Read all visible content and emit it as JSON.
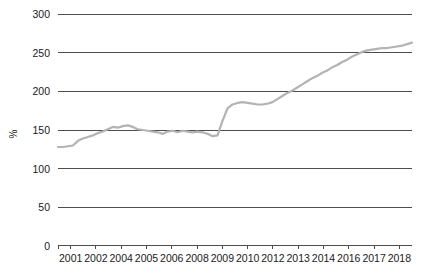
{
  "chart_data": {
    "type": "line",
    "title": "",
    "subtitle": "",
    "xlabel": "",
    "ylabel": "%",
    "ylim": [
      0,
      300
    ],
    "xlim": [
      2001,
      2018.75
    ],
    "y_ticks": [
      0,
      50,
      100,
      150,
      200,
      250,
      300
    ],
    "y_tick_labels": [
      "0",
      "50",
      "100",
      "150",
      "200",
      "250",
      "300"
    ],
    "x_tick_labels": [
      "2001",
      "2002",
      "2004",
      "2005",
      "2006",
      "2008",
      "2009",
      "2010",
      "2012",
      "2013",
      "2014",
      "2016",
      "2017",
      "2018"
    ],
    "grid": "horizontal",
    "legend": "none",
    "series": [
      {
        "name": "ratio",
        "color": "#b3b3b3",
        "line_width": 2.2,
        "x": [
          2001.0,
          2001.25,
          2001.5,
          2001.75,
          2002.0,
          2002.25,
          2002.5,
          2002.75,
          2003.0,
          2003.25,
          2003.5,
          2003.75,
          2004.0,
          2004.25,
          2004.5,
          2004.75,
          2005.0,
          2005.25,
          2005.5,
          2005.75,
          2006.0,
          2006.25,
          2006.5,
          2006.75,
          2007.0,
          2007.25,
          2007.5,
          2007.75,
          2008.0,
          2008.25,
          2008.5,
          2008.75,
          2009.0,
          2009.25,
          2009.5,
          2009.75,
          2010.0,
          2010.25,
          2010.5,
          2010.75,
          2011.0,
          2011.25,
          2011.5,
          2011.75,
          2012.0,
          2012.25,
          2012.5,
          2012.75,
          2013.0,
          2013.25,
          2013.5,
          2013.75,
          2014.0,
          2014.25,
          2014.5,
          2014.75,
          2015.0,
          2015.25,
          2015.5,
          2015.75,
          2016.0,
          2016.25,
          2016.5,
          2016.75,
          2017.0,
          2017.25,
          2017.5,
          2017.75,
          2018.0,
          2018.25,
          2018.5,
          2018.75
        ],
        "values": [
          128,
          128,
          129,
          130,
          136,
          139,
          141,
          143,
          146,
          148,
          151,
          154,
          153,
          155,
          156,
          154,
          151,
          150,
          149,
          148,
          147,
          145,
          148,
          149,
          147,
          149,
          148,
          147,
          148,
          147,
          145,
          142,
          143,
          162,
          178,
          183,
          185,
          186,
          185,
          184,
          183,
          183,
          184,
          186,
          190,
          194,
          198,
          201,
          205,
          209,
          213,
          217,
          220,
          224,
          227,
          231,
          234,
          238,
          241,
          245,
          248,
          251,
          253,
          254,
          255,
          256,
          256,
          257,
          258,
          259,
          261,
          263
        ]
      }
    ]
  },
  "axis": {
    "y_title": "%"
  }
}
